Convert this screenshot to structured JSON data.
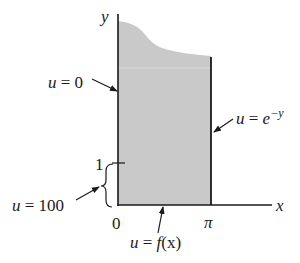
{
  "diagram": {
    "axes": {
      "x_label": "x",
      "y_label": "y",
      "origin_label": "0",
      "x_tick_label": "π",
      "y_tick_label": "1"
    },
    "boundary_conditions": {
      "left": {
        "var": "u",
        "eq": " = ",
        "val": "0"
      },
      "right": {
        "var": "u",
        "eq": " = ",
        "base": "e",
        "exp": "−y"
      },
      "bottom": {
        "var": "u",
        "eq": " = ",
        "fn": "f",
        "arg": "(x)"
      },
      "left_segment": {
        "var": "u",
        "eq": " = ",
        "val": "100"
      }
    },
    "colors": {
      "region_fill": "#c9c9c9",
      "line": "#1a1a1a",
      "background": "#ffffff"
    }
  }
}
